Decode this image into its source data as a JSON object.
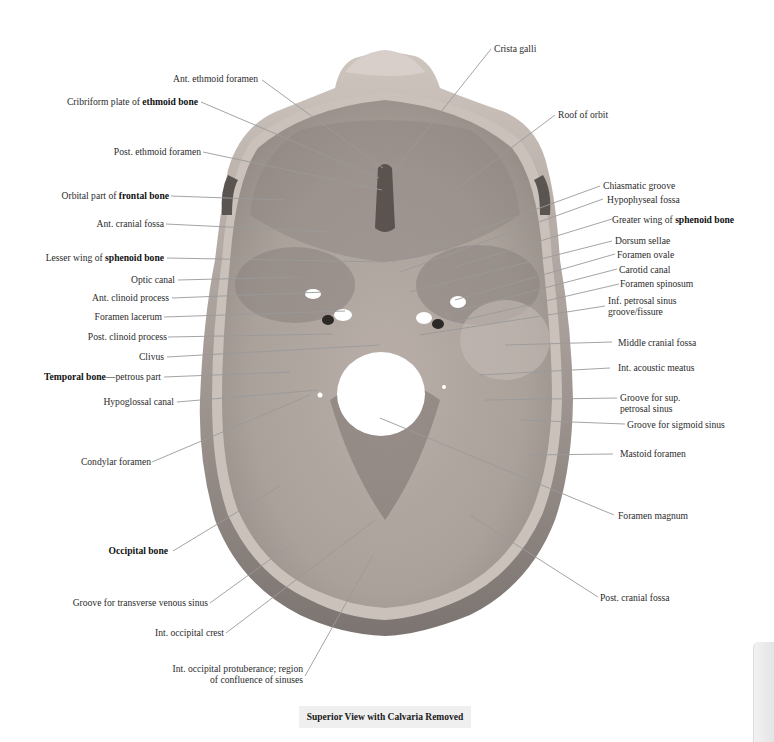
{
  "figure": {
    "title": "Superior View with Calvaria Removed",
    "colors": {
      "background": "#ffffff",
      "bone_light": "#c9bcb4",
      "bone_mid": "#a9a09a",
      "bone_dark": "#7f7773",
      "leader_line": "#9a9a9a",
      "caption_bg": "#efefef"
    }
  },
  "labels_left": [
    {
      "id": "ant-ethmoid-foramen",
      "text": "Ant. ethmoid foramen",
      "bold": ""
    },
    {
      "id": "cribriform-plate",
      "text": "Cribriform plate of ",
      "bold": "ethmoid bone"
    },
    {
      "id": "post-ethmoid-foramen",
      "text": "Post. ethmoid foramen",
      "bold": ""
    },
    {
      "id": "orbital-part-frontal",
      "text": "Orbital part of ",
      "bold": "frontal bone"
    },
    {
      "id": "ant-cranial-fossa",
      "text": "Ant. cranial fossa",
      "bold": ""
    },
    {
      "id": "lesser-wing-sphenoid",
      "text": "Lesser wing of ",
      "bold": "sphenoid bone"
    },
    {
      "id": "optic-canal",
      "text": "Optic canal",
      "bold": ""
    },
    {
      "id": "ant-clinoid-process",
      "text": "Ant. clinoid process",
      "bold": ""
    },
    {
      "id": "foramen-lacerum",
      "text": "Foramen lacerum",
      "bold": ""
    },
    {
      "id": "post-clinoid-process",
      "text": "Post. clinoid process",
      "bold": ""
    },
    {
      "id": "clivus",
      "text": "Clivus",
      "bold": ""
    },
    {
      "id": "temporal-bone-petrous",
      "text": "—petrous part",
      "bold": "Temporal bone",
      "bold_first": true
    },
    {
      "id": "hypoglossal-canal",
      "text": "Hypoglossal canal",
      "bold": ""
    },
    {
      "id": "condylar-foramen",
      "text": "Condylar foramen",
      "bold": ""
    },
    {
      "id": "occipital-bone",
      "text": "",
      "bold": "Occipital bone"
    },
    {
      "id": "groove-transverse-sinus",
      "text": "Groove for transverse venous sinus",
      "bold": ""
    },
    {
      "id": "int-occipital-crest",
      "text": "Int. occipital crest",
      "bold": ""
    },
    {
      "id": "int-occipital-protuberance",
      "text": "Int. occipital protuberance; region",
      "line2": "of confluence of sinuses",
      "bold": ""
    }
  ],
  "labels_right": [
    {
      "id": "crista-galli",
      "text": "Crista galli",
      "bold": ""
    },
    {
      "id": "roof-of-orbit",
      "text": "Roof of orbit",
      "bold": ""
    },
    {
      "id": "chiasmatic-groove",
      "text": "Chiasmatic groove",
      "bold": ""
    },
    {
      "id": "hypophyseal-fossa",
      "text": "Hypophyseal fossa",
      "bold": ""
    },
    {
      "id": "greater-wing-sphenoid",
      "text": "Greater wing of ",
      "bold": "sphenoid bone"
    },
    {
      "id": "dorsum-sellae",
      "text": "Dorsum sellae",
      "bold": ""
    },
    {
      "id": "foramen-ovale",
      "text": "Foramen ovale",
      "bold": ""
    },
    {
      "id": "carotid-canal",
      "text": "Carotid canal",
      "bold": ""
    },
    {
      "id": "foramen-spinosum",
      "text": "Foramen spinosum",
      "bold": ""
    },
    {
      "id": "inf-petrosal-sinus",
      "text": "Inf. petrosal sinus",
      "line2": "groove/fissure",
      "bold": ""
    },
    {
      "id": "middle-cranial-fossa",
      "text": "Middle cranial fossa",
      "bold": ""
    },
    {
      "id": "int-acoustic-meatus",
      "text": "Int. acoustic meatus",
      "bold": ""
    },
    {
      "id": "groove-sup-petrosal",
      "text": "Groove for sup.",
      "line2": "petrosal sinus",
      "bold": ""
    },
    {
      "id": "groove-sigmoid-sinus",
      "text": "Groove for sigmoid sinus",
      "bold": ""
    },
    {
      "id": "mastoid-foramen",
      "text": "Mastoid foramen",
      "bold": ""
    },
    {
      "id": "foramen-magnum",
      "text": "Foramen magnum",
      "bold": ""
    },
    {
      "id": "post-cranial-fossa",
      "text": "Post. cranial fossa",
      "bold": ""
    }
  ]
}
